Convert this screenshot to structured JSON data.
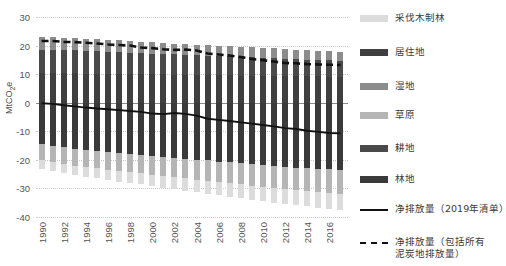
{
  "chart_data": {
    "type": "bar",
    "title": "",
    "subtitle": "",
    "xlabel": "",
    "ylabel": "MtCO2e",
    "ylabel_html": "MtCO<sub>2</sub>e",
    "ylim": [
      -40,
      30
    ],
    "yticks": [
      30,
      20,
      10,
      0,
      -10,
      -20,
      -30,
      -40
    ],
    "ytick_labels": [
      "30",
      "20",
      "10",
      "0",
      "-10",
      "-20",
      "-30",
      "-40"
    ],
    "grid": true,
    "legend_position": "right",
    "stacked": true,
    "x": [
      1990,
      1991,
      1992,
      1993,
      1994,
      1995,
      1996,
      1997,
      1998,
      1999,
      2000,
      2001,
      2002,
      2003,
      2004,
      2005,
      2006,
      2007,
      2008,
      2009,
      2010,
      2011,
      2012,
      2013,
      2014,
      2015,
      2016,
      2017
    ],
    "xtick_labels": [
      "1990",
      "1992",
      "1994",
      "1996",
      "1998",
      "2000",
      "2002",
      "2004",
      "2006",
      "2008",
      "2010",
      "2012",
      "2014",
      "2016"
    ],
    "xtick_values": [
      1990,
      1992,
      1994,
      1996,
      1998,
      2000,
      2002,
      2004,
      2006,
      2008,
      2010,
      2012,
      2014,
      2016
    ],
    "series": [
      {
        "name": "居住地",
        "color": "#3f3f3f",
        "sign": "positive",
        "values": [
          10.4,
          10.4,
          10.3,
          10.3,
          10.2,
          10.2,
          10.1,
          10.1,
          10.0,
          10.0,
          9.9,
          9.9,
          9.8,
          9.8,
          9.7,
          9.7,
          9.6,
          9.6,
          9.5,
          9.5,
          9.4,
          9.4,
          9.3,
          9.3,
          9.2,
          9.2,
          9.1,
          9.1
        ]
      },
      {
        "name": "耕地",
        "color": "#4a4a4a",
        "sign": "positive",
        "values": [
          8.2,
          8.1,
          8.1,
          8.0,
          7.9,
          7.8,
          7.7,
          7.6,
          7.5,
          7.4,
          7.3,
          7.2,
          7.1,
          7.0,
          6.9,
          6.8,
          6.7,
          6.6,
          6.5,
          6.4,
          6.3,
          6.2,
          6.1,
          6.0,
          5.9,
          5.8,
          5.7,
          5.6
        ]
      },
      {
        "name": "湿地",
        "color": "#8c8c8c",
        "sign": "positive",
        "values": [
          4.4,
          4.4,
          4.3,
          4.3,
          4.2,
          4.2,
          4.1,
          4.1,
          4.0,
          4.0,
          3.9,
          3.9,
          3.8,
          3.8,
          3.7,
          3.7,
          3.6,
          3.6,
          3.6,
          3.5,
          3.5,
          3.4,
          3.4,
          3.3,
          3.3,
          3.2,
          3.2,
          3.1
        ]
      },
      {
        "name": "林地",
        "color": "#3a3a3a",
        "sign": "negative",
        "values": [
          -14.6,
          -15.1,
          -15.6,
          -16.1,
          -16.6,
          -16.9,
          -17.2,
          -17.6,
          -17.9,
          -18.2,
          -18.6,
          -18.9,
          -19.2,
          -19.6,
          -19.9,
          -20.2,
          -20.6,
          -20.9,
          -21.2,
          -21.6,
          -21.9,
          -22.2,
          -22.4,
          -22.7,
          -22.9,
          -23.1,
          -23.3,
          -23.5
        ]
      },
      {
        "name": "草原",
        "color": "#b5b5b5",
        "sign": "negative",
        "values": [
          -5.6,
          -5.7,
          -5.8,
          -5.9,
          -6.0,
          -6.1,
          -6.2,
          -6.3,
          -6.4,
          -6.5,
          -6.6,
          -6.7,
          -6.8,
          -6.9,
          -7.0,
          -7.1,
          -7.2,
          -7.3,
          -7.4,
          -7.5,
          -7.6,
          -7.7,
          -7.8,
          -7.9,
          -8.0,
          -8.1,
          -8.2,
          -8.3
        ]
      },
      {
        "name": "采伐木制林",
        "color": "#dcdcdc",
        "sign": "negative",
        "values": [
          -3.0,
          -3.1,
          -3.2,
          -3.3,
          -3.4,
          -3.5,
          -3.6,
          -3.7,
          -3.8,
          -3.9,
          -4.0,
          -4.1,
          -4.2,
          -4.3,
          -4.4,
          -4.5,
          -4.6,
          -4.7,
          -4.8,
          -4.9,
          -5.0,
          -5.1,
          -5.2,
          -5.3,
          -5.4,
          -5.5,
          -5.6,
          -5.7
        ]
      }
    ],
    "lines": [
      {
        "name": "净排放量（2019年清单）",
        "style": "solid",
        "color": "#111111",
        "values": [
          -0.2,
          -0.4,
          -0.9,
          -1.3,
          -1.7,
          -2.0,
          -2.3,
          -2.6,
          -2.9,
          -3.2,
          -3.8,
          -4.0,
          -3.6,
          -3.9,
          -4.5,
          -5.6,
          -6.0,
          -6.4,
          -6.9,
          -7.3,
          -7.8,
          -8.3,
          -8.9,
          -9.2,
          -9.8,
          -10.2,
          -10.6,
          -10.7
        ]
      },
      {
        "name": "净排放量（包括所有泥炭地排放量）",
        "style": "dashed",
        "color": "#111111",
        "values": [
          21.6,
          21.6,
          21.3,
          21.2,
          21.0,
          20.7,
          20.4,
          20.2,
          20.0,
          19.3,
          19.1,
          18.7,
          18.5,
          18.6,
          18.3,
          17.2,
          16.9,
          16.5,
          16.0,
          15.3,
          14.9,
          14.4,
          13.9,
          13.8,
          13.5,
          13.4,
          13.3,
          13.2
        ]
      }
    ]
  },
  "legend": {
    "items": [
      {
        "label": "采伐木制林",
        "type": "swatch",
        "color": "#dcdcdc"
      },
      {
        "label": "居住地",
        "type": "swatch",
        "color": "#3f3f3f"
      },
      {
        "label": "湿地",
        "type": "swatch",
        "color": "#8c8c8c"
      },
      {
        "label": "草原",
        "type": "swatch",
        "color": "#b5b5b5"
      },
      {
        "label": "耕地",
        "type": "swatch",
        "color": "#4a4a4a"
      },
      {
        "label": "林地",
        "type": "swatch",
        "color": "#3a3a3a"
      },
      {
        "label": "净排放量（2019年清单）",
        "type": "line",
        "color": "#111111"
      },
      {
        "label_line1": "净排放量（包括所有",
        "label_line2": "泥炭地排放量）",
        "type": "dash",
        "color": "#111111"
      }
    ]
  },
  "axis": {
    "y_title": "MtCO2e"
  }
}
